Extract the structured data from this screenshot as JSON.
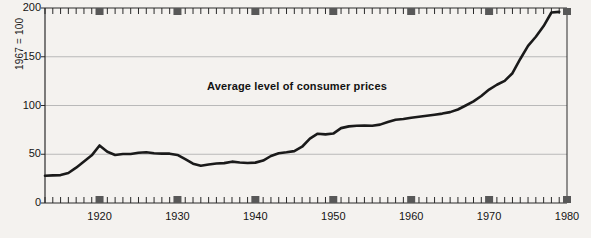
{
  "chart_data": {
    "type": "line",
    "title": "Average level of consumer prices",
    "xlabel": "",
    "ylabel": "1967 = 100",
    "xlim": [
      1913,
      1980
    ],
    "ylim": [
      0,
      200
    ],
    "yticks": [
      0,
      50,
      100,
      150,
      200
    ],
    "xticks": [
      1920,
      1930,
      1940,
      1950,
      1960,
      1970,
      1980
    ],
    "xtick_labels": [
      "1920",
      "1930",
      "1940",
      "1950",
      "1960",
      "1970",
      "1980"
    ],
    "minor_x_interval": 1,
    "grid": "horizontal",
    "legend": "none",
    "line_color": "#1a1a1a",
    "grid_color": "#b9b9b9",
    "axis_color": "#2a2a2a",
    "marker_color": "#585858",
    "background": "#f4f2ef",
    "x": [
      1913,
      1914,
      1915,
      1916,
      1917,
      1918,
      1919,
      1920,
      1921,
      1922,
      1923,
      1924,
      1925,
      1926,
      1927,
      1928,
      1929,
      1930,
      1931,
      1932,
      1933,
      1934,
      1935,
      1936,
      1937,
      1938,
      1939,
      1940,
      1941,
      1942,
      1943,
      1944,
      1945,
      1946,
      1947,
      1948,
      1949,
      1950,
      1951,
      1952,
      1953,
      1954,
      1955,
      1956,
      1957,
      1958,
      1959,
      1960,
      1961,
      1962,
      1963,
      1964,
      1965,
      1966,
      1967,
      1968,
      1969,
      1970,
      1971,
      1972,
      1973,
      1974,
      1975,
      1976,
      1977,
      1978,
      1979
    ],
    "values": [
      28.0,
      28.3,
      28.6,
      30.8,
      36.2,
      42.6,
      48.9,
      59.0,
      52.6,
      49.3,
      50.2,
      50.3,
      51.6,
      52.1,
      51.1,
      50.6,
      50.6,
      49.3,
      44.9,
      40.3,
      38.2,
      39.5,
      40.5,
      40.9,
      42.4,
      41.6,
      41.0,
      41.4,
      43.5,
      48.2,
      51.1,
      52.0,
      53.2,
      57.7,
      66.0,
      71.1,
      70.4,
      71.2,
      76.8,
      78.6,
      79.2,
      79.4,
      79.2,
      80.4,
      83.1,
      85.4,
      86.1,
      87.5,
      88.4,
      89.4,
      90.5,
      91.7,
      93.2,
      95.9,
      100.0,
      104.2,
      109.8,
      116.3,
      121.3,
      125.3,
      133.1,
      147.7,
      161.2,
      170.5,
      181.5,
      195.4,
      196.0
    ]
  }
}
